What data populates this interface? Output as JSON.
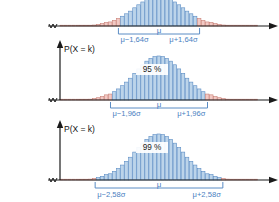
{
  "figure": {
    "axis_x_label": "X",
    "axis_y_label": "P(X = k)",
    "colors": {
      "center_fill": "#bcd4ea",
      "center_stroke": "#5b8cc4",
      "tail_fill": "#f2c9c4",
      "tail_stroke": "#c87f76",
      "bracket": "#5b8cc4",
      "axis": "#1a1a1a",
      "label_blue": "#4a7fc1"
    }
  },
  "panels": [
    {
      "id": "panel-90",
      "y_axis_label": "",
      "x_axis_label": "X",
      "percent_label": "",
      "mu_label": "μ",
      "left_label": "μ−1,64σ",
      "right_label": "μ+1,64σ",
      "z": 1.64,
      "confidence": 90
    },
    {
      "id": "panel-95",
      "y_axis_label": "P(X = k)",
      "x_axis_label": "X",
      "percent_label": "95 %",
      "mu_label": "μ",
      "left_label": "μ−1,96σ",
      "right_label": "μ+1,96σ",
      "z": 1.96,
      "confidence": 95
    },
    {
      "id": "panel-99",
      "y_axis_label": "P(X = k)",
      "x_axis_label": "X",
      "percent_label": "99 %",
      "mu_label": "μ",
      "left_label": "μ−2,58σ",
      "right_label": "μ+2,58σ",
      "z": 2.58,
      "confidence": 99
    }
  ],
  "chart_data": {
    "type": "bar",
    "xlabel": "X",
    "ylabel": "P(X = k)",
    "subcharts": [
      {
        "name": "90 % confidence interval",
        "confidence": 90,
        "z": 1.64,
        "interval_labels": [
          "μ−1,64σ",
          "μ+1,64σ"
        ],
        "center_label": "μ",
        "percent_label": "",
        "n_bars": 49,
        "categories": [
          -4.0,
          -3.833,
          -3.667,
          -3.5,
          -3.333,
          -3.167,
          -3.0,
          -2.833,
          -2.667,
          -2.5,
          -2.333,
          -2.167,
          -2.0,
          -1.833,
          -1.667,
          -1.5,
          -1.333,
          -1.167,
          -1.0,
          -0.833,
          -0.667,
          -0.5,
          -0.333,
          -0.167,
          0.0,
          0.167,
          0.333,
          0.5,
          0.667,
          0.833,
          1.0,
          1.167,
          1.333,
          1.5,
          1.667,
          1.833,
          2.0,
          2.167,
          2.333,
          2.5,
          2.667,
          2.833,
          3.0,
          3.167,
          3.333,
          3.5,
          3.667,
          3.833,
          4.0
        ],
        "values": [
          0.0001,
          0.0003,
          0.0007,
          0.0015,
          0.0031,
          0.006,
          0.0111,
          0.0194,
          0.0324,
          0.0519,
          0.0796,
          0.117,
          0.1353,
          0.1887,
          0.2516,
          0.3247,
          0.4066,
          0.495,
          0.6065,
          0.7066,
          0.8007,
          0.8825,
          0.946,
          0.9862,
          1.0,
          0.9862,
          0.946,
          0.8825,
          0.8007,
          0.7066,
          0.6065,
          0.495,
          0.4066,
          0.3247,
          0.2516,
          0.1887,
          0.1353,
          0.117,
          0.0796,
          0.0519,
          0.0324,
          0.0194,
          0.0111,
          0.006,
          0.0031,
          0.0015,
          0.0007,
          0.0003,
          0.0001
        ],
        "tail_region": "outside |x| > 1.64",
        "center_region": "inside |x| <= 1.64"
      },
      {
        "name": "95 % confidence interval",
        "confidence": 95,
        "z": 1.96,
        "interval_labels": [
          "μ−1,96σ",
          "μ+1,96σ"
        ],
        "center_label": "μ",
        "percent_label": "95 %",
        "n_bars": 49,
        "categories": [
          -4.0,
          -3.833,
          -3.667,
          -3.5,
          -3.333,
          -3.167,
          -3.0,
          -2.833,
          -2.667,
          -2.5,
          -2.333,
          -2.167,
          -2.0,
          -1.833,
          -1.667,
          -1.5,
          -1.333,
          -1.167,
          -1.0,
          -0.833,
          -0.667,
          -0.5,
          -0.333,
          -0.167,
          0.0,
          0.167,
          0.333,
          0.5,
          0.667,
          0.833,
          1.0,
          1.167,
          1.333,
          1.5,
          1.667,
          1.833,
          2.0,
          2.167,
          2.333,
          2.5,
          2.667,
          2.833,
          3.0,
          3.167,
          3.333,
          3.5,
          3.667,
          3.833,
          4.0
        ],
        "values": [
          0.0001,
          0.0003,
          0.0007,
          0.0015,
          0.0031,
          0.006,
          0.0111,
          0.0194,
          0.0324,
          0.0519,
          0.0796,
          0.117,
          0.1353,
          0.1887,
          0.2516,
          0.3247,
          0.4066,
          0.495,
          0.6065,
          0.7066,
          0.8007,
          0.8825,
          0.946,
          0.9862,
          1.0,
          0.9862,
          0.946,
          0.8825,
          0.8007,
          0.7066,
          0.6065,
          0.495,
          0.4066,
          0.3247,
          0.2516,
          0.1887,
          0.1353,
          0.117,
          0.0796,
          0.0519,
          0.0324,
          0.0194,
          0.0111,
          0.006,
          0.0031,
          0.0015,
          0.0007,
          0.0003,
          0.0001
        ],
        "tail_region": "outside |x| > 1.96",
        "center_region": "inside |x| <= 1.96"
      },
      {
        "name": "99 % confidence interval",
        "confidence": 99,
        "z": 2.58,
        "interval_labels": [
          "μ−2,58σ",
          "μ+2,58σ"
        ],
        "center_label": "μ",
        "percent_label": "99 %",
        "n_bars": 49,
        "categories": [
          -4.0,
          -3.833,
          -3.667,
          -3.5,
          -3.333,
          -3.167,
          -3.0,
          -2.833,
          -2.667,
          -2.5,
          -2.333,
          -2.167,
          -2.0,
          -1.833,
          -1.667,
          -1.5,
          -1.333,
          -1.167,
          -1.0,
          -0.833,
          -0.667,
          -0.5,
          -0.333,
          -0.167,
          0.0,
          0.167,
          0.333,
          0.5,
          0.667,
          0.833,
          1.0,
          1.167,
          1.333,
          1.5,
          1.667,
          1.833,
          2.0,
          2.167,
          2.333,
          2.5,
          2.667,
          2.833,
          3.0,
          3.167,
          3.333,
          3.5,
          3.667,
          3.833,
          4.0
        ],
        "values": [
          0.0001,
          0.0003,
          0.0007,
          0.0015,
          0.0031,
          0.006,
          0.0111,
          0.0194,
          0.0324,
          0.0519,
          0.0796,
          0.117,
          0.1353,
          0.1887,
          0.2516,
          0.3247,
          0.4066,
          0.495,
          0.6065,
          0.7066,
          0.8007,
          0.8825,
          0.946,
          0.9862,
          1.0,
          0.9862,
          0.946,
          0.8825,
          0.8007,
          0.7066,
          0.6065,
          0.495,
          0.4066,
          0.3247,
          0.2516,
          0.1887,
          0.1353,
          0.117,
          0.0796,
          0.0519,
          0.0324,
          0.0194,
          0.0111,
          0.006,
          0.0031,
          0.0015,
          0.0007,
          0.0003,
          0.0001
        ],
        "tail_region": "outside |x| > 2.58",
        "center_region": "inside |x| <= 2.58"
      }
    ],
    "grid": false,
    "legend": "none"
  }
}
